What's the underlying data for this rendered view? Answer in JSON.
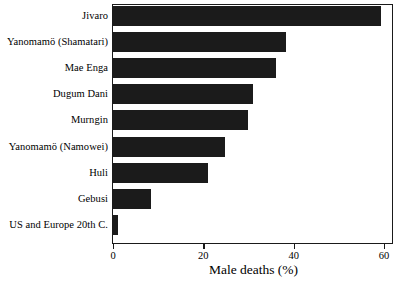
{
  "chart_data": {
    "type": "bar",
    "orientation": "horizontal",
    "title": "",
    "xlabel": "Male deaths (%)",
    "ylabel": "",
    "xlim": [
      0,
      62
    ],
    "xticks": [
      0,
      20,
      40,
      60
    ],
    "xtick_labels": [
      "0",
      "20",
      "40",
      "60"
    ],
    "grid": false,
    "legend": null,
    "bar_color": "#1b1b1b",
    "frame_color": "#1a1a1a",
    "background": "#ffffff",
    "categories": [
      "Jivaro",
      "Yanomamö (Shamatari)",
      "Mae Enga",
      "Dugum Dani",
      "Murngin",
      "Yanomamö (Namowei)",
      "Huli",
      "Gebusi",
      "US and Europe 20th C."
    ],
    "values": [
      59.4,
      38.4,
      36.0,
      31.0,
      30.0,
      24.8,
      21.0,
      8.4,
      1.0
    ]
  }
}
